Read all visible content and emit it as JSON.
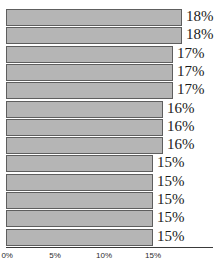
{
  "chart_data": {
    "type": "bar",
    "orientation": "horizontal",
    "title": "",
    "subtitle": "",
    "xlabel": "",
    "ylabel": "",
    "grid": false,
    "legend": null,
    "legend_position": "none",
    "xlim": [
      0,
      21
    ],
    "xticks": [
      0,
      5,
      10,
      15
    ],
    "xtick_labels": [
      "0%",
      "5%",
      "10%",
      "15%"
    ],
    "categories": [
      "",
      "",
      "",
      "",
      "",
      "",
      "",
      "",
      "",
      "",
      "",
      "",
      ""
    ],
    "values": [
      18,
      18,
      17,
      17,
      17,
      16,
      16,
      16,
      15,
      15,
      15,
      15,
      15
    ],
    "data_labels": [
      "18%",
      "18%",
      "17%",
      "17%",
      "17%",
      "16%",
      "16%",
      "16%",
      "15%",
      "15%",
      "15%",
      "15%",
      "15%"
    ],
    "bar_count": 13,
    "colors": {
      "bar_fill": "#b5b5b5",
      "bar_border": "#5e5e5e",
      "axis": "#3a3a3a",
      "label_text": "#1b1b1b",
      "tick_text": "#2b2b2b",
      "background": "#ffffff"
    }
  }
}
